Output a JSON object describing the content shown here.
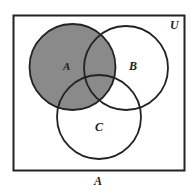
{
  "diagram": {
    "type": "venn",
    "universe_label": "U",
    "caption": "A",
    "sets": [
      {
        "name": "A",
        "label": "A",
        "shaded": true
      },
      {
        "name": "B",
        "label": "B",
        "shaded": false
      },
      {
        "name": "C",
        "label": "C",
        "shaded": false
      }
    ],
    "shaded_region": "A",
    "colors": {
      "shade": "#8a8a8a",
      "stroke": "#222222",
      "background": "#ffffff"
    }
  }
}
